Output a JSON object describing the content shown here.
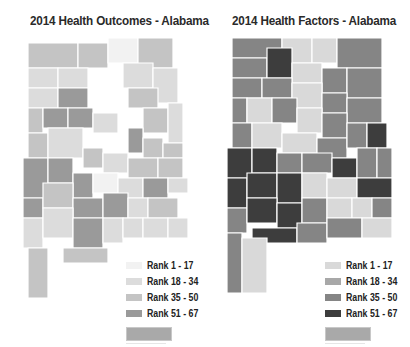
{
  "maps": [
    {
      "title": "2014 Health Outcomes - Alabama",
      "legend": [
        {
          "label": "Rank 1 - 17",
          "color": "#f2f2f2"
        },
        {
          "label": "Rank 18 - 34",
          "color": "#dcdcdc"
        },
        {
          "label": "Rank 35 - 50",
          "color": "#c4c4c4"
        },
        {
          "label": "Rank 51 - 67",
          "color": "#9a9a9a"
        }
      ]
    },
    {
      "title": "2014 Health Factors - Alabama",
      "legend": [
        {
          "label": "Rank 1 - 17",
          "color": "#d9d9d9"
        },
        {
          "label": "Rank 18 - 34",
          "color": "#a8a8a8"
        },
        {
          "label": "Rank 35 - 50",
          "color": "#858585"
        },
        {
          "label": "Rank 51 - 67",
          "color": "#3d3d3d"
        }
      ]
    }
  ]
}
